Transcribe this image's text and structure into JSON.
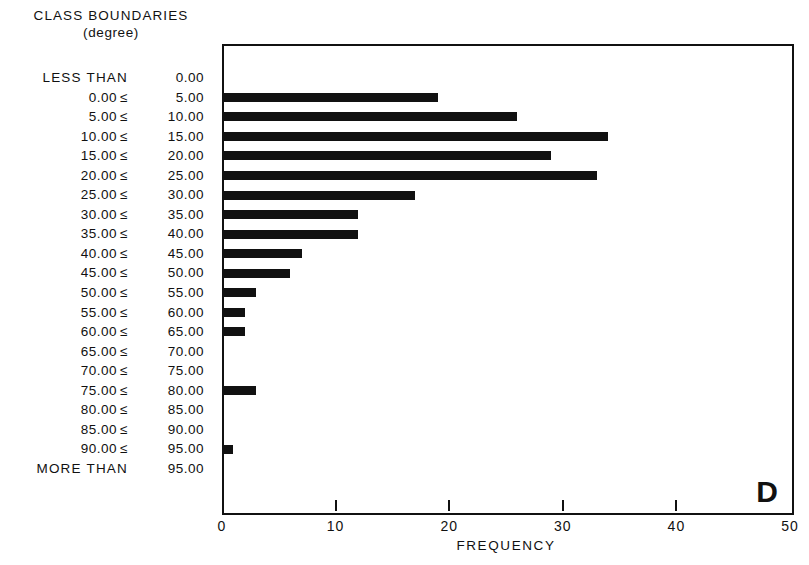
{
  "header": {
    "title": "CLASS BOUNDARIES",
    "subtitle": "(degree)"
  },
  "panel_label": "D",
  "axis": {
    "x_title": "FREQUENCY",
    "x_ticks": [
      "0",
      "10",
      "20",
      "30",
      "40",
      "50"
    ]
  },
  "rows": [
    {
      "lower": "LESS THAN",
      "op": "",
      "upper": "0.00",
      "wide": true,
      "value": 0
    },
    {
      "lower": "0.00",
      "op": "≤",
      "upper": "5.00",
      "wide": false,
      "value": 19
    },
    {
      "lower": "5.00",
      "op": "≤",
      "upper": "10.00",
      "wide": false,
      "value": 26
    },
    {
      "lower": "10.00",
      "op": "≤",
      "upper": "15.00",
      "wide": false,
      "value": 34
    },
    {
      "lower": "15.00",
      "op": "≤",
      "upper": "20.00",
      "wide": false,
      "value": 29
    },
    {
      "lower": "20.00",
      "op": "≤",
      "upper": "25.00",
      "wide": false,
      "value": 33
    },
    {
      "lower": "25.00",
      "op": "≤",
      "upper": "30.00",
      "wide": false,
      "value": 17
    },
    {
      "lower": "30.00",
      "op": "≤",
      "upper": "35.00",
      "wide": false,
      "value": 12
    },
    {
      "lower": "35.00",
      "op": "≤",
      "upper": "40.00",
      "wide": false,
      "value": 12
    },
    {
      "lower": "40.00",
      "op": "≤",
      "upper": "45.00",
      "wide": false,
      "value": 7
    },
    {
      "lower": "45.00",
      "op": "≤",
      "upper": "50.00",
      "wide": false,
      "value": 6
    },
    {
      "lower": "50.00",
      "op": "≤",
      "upper": "55.00",
      "wide": false,
      "value": 3
    },
    {
      "lower": "55.00",
      "op": "≤",
      "upper": "60.00",
      "wide": false,
      "value": 2
    },
    {
      "lower": "60.00",
      "op": "≤",
      "upper": "65.00",
      "wide": false,
      "value": 2
    },
    {
      "lower": "65.00",
      "op": "≤",
      "upper": "70.00",
      "wide": false,
      "value": 0
    },
    {
      "lower": "70.00",
      "op": "≤",
      "upper": "75.00",
      "wide": false,
      "value": 0
    },
    {
      "lower": "75.00",
      "op": "≤",
      "upper": "80.00",
      "wide": false,
      "value": 3
    },
    {
      "lower": "80.00",
      "op": "≤",
      "upper": "85.00",
      "wide": false,
      "value": 0
    },
    {
      "lower": "85.00",
      "op": "≤",
      "upper": "90.00",
      "wide": false,
      "value": 0
    },
    {
      "lower": "90.00",
      "op": "≤",
      "upper": "95.00",
      "wide": false,
      "value": 1
    },
    {
      "lower": "MORE THAN",
      "op": "",
      "upper": "95.00",
      "wide": true,
      "value": 0
    }
  ],
  "chart_data": {
    "type": "bar",
    "orientation": "horizontal",
    "title": "CLASS BOUNDARIES (degree)",
    "panel_label": "D",
    "xlabel": "FREQUENCY",
    "ylabel": "CLASS BOUNDARIES (degree)",
    "xlim": [
      0,
      50
    ],
    "xticks": [
      0,
      10,
      20,
      30,
      40,
      50
    ],
    "grid": false,
    "legend": "none",
    "categories": [
      "LESS THAN 0.00",
      "0.00 ≤ 5.00",
      "5.00 ≤ 10.00",
      "10.00 ≤ 15.00",
      "15.00 ≤ 20.00",
      "20.00 ≤ 25.00",
      "25.00 ≤ 30.00",
      "30.00 ≤ 35.00",
      "35.00 ≤ 40.00",
      "40.00 ≤ 45.00",
      "45.00 ≤ 50.00",
      "50.00 ≤ 55.00",
      "55.00 ≤ 60.00",
      "60.00 ≤ 65.00",
      "65.00 ≤ 70.00",
      "70.00 ≤ 75.00",
      "75.00 ≤ 80.00",
      "80.00 ≤ 85.00",
      "85.00 ≤ 90.00",
      "90.00 ≤ 95.00",
      "MORE THAN 95.00"
    ],
    "values": [
      0,
      19,
      26,
      34,
      29,
      33,
      17,
      12,
      12,
      7,
      6,
      3,
      2,
      2,
      0,
      0,
      3,
      0,
      0,
      1,
      0
    ]
  }
}
